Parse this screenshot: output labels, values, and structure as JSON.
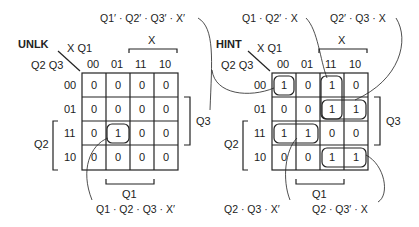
{
  "maps": [
    {
      "id": "unlk",
      "title": "UNLK",
      "var_corner": {
        "top": "X Q1",
        "left": "Q2 Q3"
      },
      "col_headers": [
        "00",
        "01",
        "11",
        "10"
      ],
      "row_headers": [
        "00",
        "01",
        "11",
        "10"
      ],
      "cells": [
        [
          "0",
          "0",
          "0",
          "0"
        ],
        [
          "0",
          "0",
          "0",
          "0"
        ],
        [
          "0",
          "1",
          "0",
          "0"
        ],
        [
          "0",
          "0",
          "0",
          "0"
        ]
      ],
      "brackets": {
        "top": "X",
        "right": "Q3",
        "left": "Q2",
        "bottom": "Q1"
      },
      "terms": [
        {
          "label": "Q1′ · Q2′ · Q3′ · X′"
        },
        {
          "label": "Q1 · Q2 · Q3 · X′"
        }
      ]
    },
    {
      "id": "hint",
      "title": "HINT",
      "var_corner": {
        "top": "X Q1",
        "left": "Q2 Q3"
      },
      "col_headers": [
        "00",
        "01",
        "11",
        "10"
      ],
      "row_headers": [
        "00",
        "01",
        "11",
        "10"
      ],
      "cells": [
        [
          "1",
          "0",
          "1",
          "0"
        ],
        [
          "0",
          "0",
          "1",
          "1"
        ],
        [
          "1",
          "1",
          "0",
          "0"
        ],
        [
          "0",
          "0",
          "1",
          "1"
        ]
      ],
      "brackets": {
        "top": "X",
        "right": "Q3",
        "left": "Q2",
        "bottom": "Q1"
      },
      "terms": [
        {
          "label": "Q1 · Q2′ · X"
        },
        {
          "label": "Q2′ · Q3 · X"
        },
        {
          "label": "Q2 · Q3 · X′"
        },
        {
          "label": "Q2 · Q3′ · X"
        }
      ]
    }
  ]
}
